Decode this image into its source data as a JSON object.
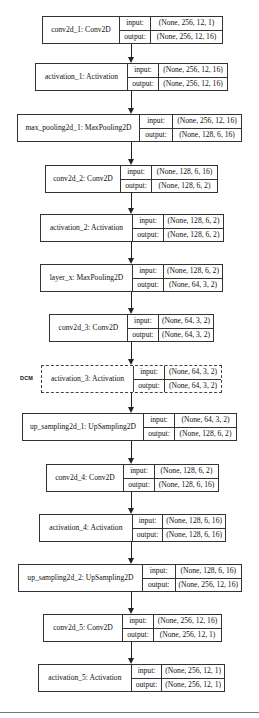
{
  "diagram": {
    "type": "keras-model-plot",
    "io_labels": {
      "input": "input:",
      "output": "output:"
    },
    "side_annotation": "DCM",
    "layers": [
      {
        "name": "conv2d_1: Conv2D",
        "input": "(None, 256, 12, 1)",
        "output": "(None, 256, 12, 16)",
        "dashed": false
      },
      {
        "name": "activation_1: Activation",
        "input": "(None, 256, 12, 16)",
        "output": "(None, 256, 12, 16)",
        "dashed": false
      },
      {
        "name": "max_pooling2d_1: MaxPooling2D",
        "input": "(None, 256, 12, 16)",
        "output": "(None, 128, 6, 16)",
        "dashed": false
      },
      {
        "name": "conv2d_2: Conv2D",
        "input": "(None, 128, 6, 16)",
        "output": "(None, 128, 6, 2)",
        "dashed": false
      },
      {
        "name": "activation_2: Activation",
        "input": "(None, 128, 6, 2)",
        "output": "(None, 128, 6, 2)",
        "dashed": false
      },
      {
        "name": "layer_x: MaxPooling2D",
        "input": "(None, 128, 6, 2)",
        "output": "(None, 64, 3, 2)",
        "dashed": false
      },
      {
        "name": "conv2d_3: Conv2D",
        "input": "(None, 64, 3, 2)",
        "output": "(None, 64, 3, 2)",
        "dashed": false
      },
      {
        "name": "activation_3: Activation",
        "input": "(None, 64, 3, 2)",
        "output": "(None, 64, 3, 2)",
        "dashed": true
      },
      {
        "name": "up_sampling2d_1: UpSampling2D",
        "input": "(None, 64, 3, 2)",
        "output": "(None, 128, 6, 2)",
        "dashed": false
      },
      {
        "name": "conv2d_4: Conv2D",
        "input": "(None, 128, 6, 2)",
        "output": "(None, 128, 6, 16)",
        "dashed": false
      },
      {
        "name": "activation_4: Activation",
        "input": "(None, 128, 6, 16)",
        "output": "(None, 128, 6, 16)",
        "dashed": false
      },
      {
        "name": "up_sampling2d_2: UpSampling2D",
        "input": "(None, 128, 6, 16)",
        "output": "(None, 256, 12, 16)",
        "dashed": false
      },
      {
        "name": "conv2d_5: Conv2D",
        "input": "(None, 256, 12, 16)",
        "output": "(None, 256, 12, 1)",
        "dashed": false
      },
      {
        "name": "activation_5: Activation",
        "input": "(None, 256, 12, 1)",
        "output": "(None, 256, 12, 1)",
        "dashed": false
      }
    ]
  }
}
